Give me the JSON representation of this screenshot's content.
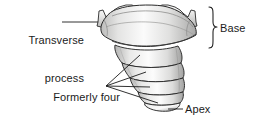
{
  "figure": {
    "view": "anterior",
    "background_color": "#ffffff",
    "line_color": "#1b1b1b",
    "bone_fill_light": "#fdfdfd",
    "bone_fill_mid": "#dededd",
    "bone_fill_shadow": "#a9a9a8",
    "text_color": "#1b1b1b"
  },
  "labels": {
    "transverse_process": {
      "line1": "Transverse",
      "line2": "process",
      "text": "Transverse\nprocess",
      "align": "right"
    },
    "formerly_segments": {
      "line1": "Formerly four",
      "line2": "separate segments",
      "text": "Formerly four\nseparate segments",
      "align": "right"
    },
    "base": {
      "text": "Base",
      "align": "left"
    },
    "apex": {
      "text": "Apex",
      "align": "left"
    }
  },
  "annotations": {
    "bracket_label": "Base",
    "segment_count": 4,
    "leader_line_count_segments": 4
  }
}
